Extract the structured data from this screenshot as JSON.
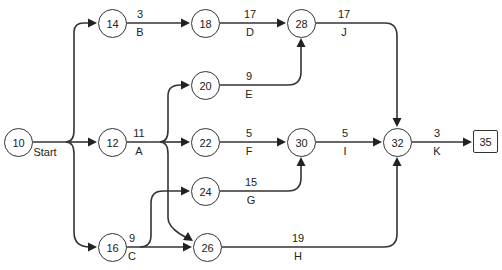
{
  "diagram": {
    "type": "activity-on-arrow network",
    "start_label": "Start",
    "nodes": [
      {
        "id": "10",
        "x": 18,
        "y": 142
      },
      {
        "id": "12",
        "x": 112,
        "y": 142
      },
      {
        "id": "14",
        "x": 112,
        "y": 23
      },
      {
        "id": "16",
        "x": 112,
        "y": 247
      },
      {
        "id": "18",
        "x": 205,
        "y": 23
      },
      {
        "id": "20",
        "x": 205,
        "y": 85
      },
      {
        "id": "22",
        "x": 205,
        "y": 142
      },
      {
        "id": "24",
        "x": 205,
        "y": 191
      },
      {
        "id": "26",
        "x": 207,
        "y": 247
      },
      {
        "id": "28",
        "x": 301,
        "y": 23
      },
      {
        "id": "30",
        "x": 301,
        "y": 142
      },
      {
        "id": "32",
        "x": 397,
        "y": 142
      },
      {
        "id": "35",
        "x": 485,
        "y": 142,
        "shape": "square"
      }
    ],
    "activities": [
      {
        "name": "B",
        "duration": "3",
        "from": "14",
        "to": "18"
      },
      {
        "name": "D",
        "duration": "17",
        "from": "18",
        "to": "28"
      },
      {
        "name": "J",
        "duration": "17",
        "from": "28",
        "to": "32"
      },
      {
        "name": "E",
        "duration": "9",
        "from": "20",
        "to": "28"
      },
      {
        "name": "A",
        "duration": "11",
        "from": "12",
        "to": "20/22/26"
      },
      {
        "name": "F",
        "duration": "5",
        "from": "22",
        "to": "30"
      },
      {
        "name": "I",
        "duration": "5",
        "from": "30",
        "to": "32"
      },
      {
        "name": "K",
        "duration": "3",
        "from": "32",
        "to": "35"
      },
      {
        "name": "G",
        "duration": "15",
        "from": "24",
        "to": "30"
      },
      {
        "name": "C",
        "duration": "9",
        "from": "16",
        "to": "24/26"
      },
      {
        "name": "H",
        "duration": "19",
        "from": "26",
        "to": "32"
      }
    ]
  }
}
